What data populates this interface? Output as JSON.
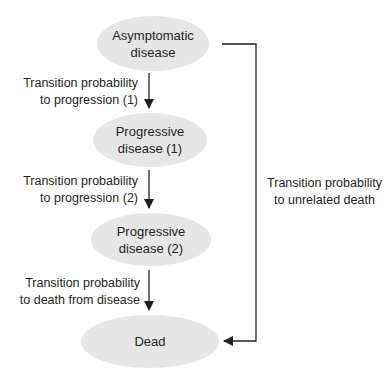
{
  "diagram": {
    "type": "state-transition",
    "nodes": [
      {
        "id": "asymptomatic",
        "lines": [
          "Asymptomatic",
          "disease"
        ]
      },
      {
        "id": "progressive1",
        "lines": [
          "Progressive",
          "disease (1)"
        ]
      },
      {
        "id": "progressive2",
        "lines": [
          "Progressive",
          "disease (2)"
        ]
      },
      {
        "id": "dead",
        "lines": [
          "Dead"
        ]
      }
    ],
    "edges": [
      {
        "from": "asymptomatic",
        "to": "progressive1",
        "label_lines": [
          "Transition probability",
          "to progression (1)"
        ]
      },
      {
        "from": "progressive1",
        "to": "progressive2",
        "label_lines": [
          "Transition probability",
          "to progression (2)"
        ]
      },
      {
        "from": "progressive2",
        "to": "dead",
        "label_lines": [
          "Transition probability",
          "to death from disease"
        ]
      },
      {
        "from": "asymptomatic",
        "to": "dead",
        "label_lines": [
          "Transition probability",
          "to unrelated death"
        ]
      }
    ],
    "colors": {
      "node_fill": "#e6e6e6",
      "line": "#231f20",
      "text": "#231f20"
    }
  }
}
